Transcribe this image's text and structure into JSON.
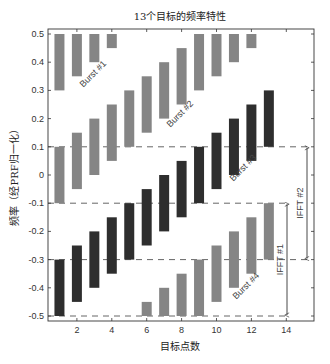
{
  "chart_data": {
    "type": "bar",
    "subtype": "floating-range-bars",
    "title": "13个目标的频率特性",
    "xlabel": "目标点数",
    "ylabel": "频率（经PRF归一化）",
    "xlim": [
      0.3,
      15
    ],
    "ylim": [
      -0.5,
      0.5
    ],
    "xticks": [
      2,
      4,
      6,
      8,
      10,
      12,
      14
    ],
    "yticks": [
      0.5,
      0.4,
      0.3,
      0.2,
      0.1,
      0,
      -0.1,
      -0.2,
      -0.3,
      -0.4,
      -0.5
    ],
    "ytick_labels": [
      "0.5",
      "0.4",
      "0.3",
      "0.2",
      "0.1",
      "0",
      "-0.1",
      "-0.2",
      "-0.3",
      "-0.4",
      "-0.5"
    ],
    "grid": false,
    "colors": {
      "gray": "#858585",
      "dark": "#2e2e2e"
    },
    "bars": [
      {
        "x": 1,
        "segments": [
          {
            "lo": 0.3,
            "hi": 0.5,
            "tone": "gray"
          },
          {
            "lo": -0.1,
            "hi": 0.1,
            "tone": "gray"
          },
          {
            "lo": -0.5,
            "hi": -0.3,
            "tone": "dark"
          }
        ]
      },
      {
        "x": 2,
        "segments": [
          {
            "lo": 0.35,
            "hi": 0.5,
            "tone": "gray"
          },
          {
            "lo": -0.05,
            "hi": 0.15,
            "tone": "gray"
          },
          {
            "lo": -0.45,
            "hi": -0.25,
            "tone": "dark"
          }
        ]
      },
      {
        "x": 3,
        "segments": [
          {
            "lo": 0.4,
            "hi": 0.5,
            "tone": "gray"
          },
          {
            "lo": 0.0,
            "hi": 0.2,
            "tone": "gray"
          },
          {
            "lo": -0.4,
            "hi": -0.2,
            "tone": "dark"
          }
        ]
      },
      {
        "x": 4,
        "segments": [
          {
            "lo": 0.45,
            "hi": 0.5,
            "tone": "gray"
          },
          {
            "lo": 0.05,
            "hi": 0.25,
            "tone": "gray"
          },
          {
            "lo": -0.35,
            "hi": -0.15,
            "tone": "dark"
          }
        ]
      },
      {
        "x": 5,
        "segments": [
          {
            "lo": 0.1,
            "hi": 0.3,
            "tone": "gray"
          },
          {
            "lo": -0.3,
            "hi": -0.1,
            "tone": "dark"
          }
        ]
      },
      {
        "x": 6,
        "segments": [
          {
            "lo": 0.15,
            "hi": 0.35,
            "tone": "gray"
          },
          {
            "lo": -0.25,
            "hi": -0.05,
            "tone": "dark"
          },
          {
            "lo": -0.5,
            "hi": -0.45,
            "tone": "gray"
          }
        ]
      },
      {
        "x": 7,
        "segments": [
          {
            "lo": 0.2,
            "hi": 0.4,
            "tone": "gray"
          },
          {
            "lo": -0.2,
            "hi": 0.0,
            "tone": "dark"
          },
          {
            "lo": -0.5,
            "hi": -0.4,
            "tone": "gray"
          }
        ]
      },
      {
        "x": 8,
        "segments": [
          {
            "lo": 0.25,
            "hi": 0.45,
            "tone": "gray"
          },
          {
            "lo": -0.15,
            "hi": 0.05,
            "tone": "dark"
          },
          {
            "lo": -0.5,
            "hi": -0.35,
            "tone": "gray"
          }
        ]
      },
      {
        "x": 9,
        "segments": [
          {
            "lo": 0.3,
            "hi": 0.5,
            "tone": "gray"
          },
          {
            "lo": -0.1,
            "hi": 0.1,
            "tone": "dark"
          },
          {
            "lo": -0.5,
            "hi": -0.3,
            "tone": "gray"
          }
        ]
      },
      {
        "x": 10,
        "segments": [
          {
            "lo": 0.35,
            "hi": 0.5,
            "tone": "gray"
          },
          {
            "lo": -0.05,
            "hi": 0.15,
            "tone": "dark"
          },
          {
            "lo": -0.45,
            "hi": -0.25,
            "tone": "gray"
          }
        ]
      },
      {
        "x": 11,
        "segments": [
          {
            "lo": 0.4,
            "hi": 0.5,
            "tone": "gray"
          },
          {
            "lo": 0.0,
            "hi": 0.2,
            "tone": "dark"
          },
          {
            "lo": -0.4,
            "hi": -0.2,
            "tone": "gray"
          }
        ]
      },
      {
        "x": 12,
        "segments": [
          {
            "lo": 0.45,
            "hi": 0.5,
            "tone": "gray"
          },
          {
            "lo": 0.05,
            "hi": 0.25,
            "tone": "dark"
          },
          {
            "lo": -0.35,
            "hi": -0.15,
            "tone": "gray"
          }
        ]
      },
      {
        "x": 13,
        "segments": [
          {
            "lo": 0.1,
            "hi": 0.3,
            "tone": "dark"
          },
          {
            "lo": -0.3,
            "hi": -0.1,
            "tone": "gray"
          }
        ]
      }
    ],
    "dashed_lines": [
      {
        "y": 0.1,
        "x_end_px": 308
      },
      {
        "y": -0.1,
        "x_end_px": 288
      },
      {
        "y": -0.3,
        "x_end_px": 308
      },
      {
        "y": -0.5,
        "x_end_px": 288
      }
    ],
    "annotations": [
      {
        "text": "Burst #1",
        "x_px": 95,
        "y_px": 76,
        "angle": -45
      },
      {
        "text": "Burst #2",
        "x_px": 182,
        "y_px": 116,
        "angle": -45
      },
      {
        "text": "Burst #3",
        "x_px": 245,
        "y_px": 170,
        "angle": -45
      },
      {
        "text": "Burst #4",
        "x_px": 248,
        "y_px": 288,
        "angle": -45
      }
    ],
    "ranges": [
      {
        "label": "IFFT #2",
        "y_top": 0.1,
        "y_bottom": -0.3,
        "x_px": 307
      },
      {
        "label": "IFFT #1",
        "y_top": -0.1,
        "y_bottom": -0.5,
        "x_px": 287
      }
    ]
  }
}
